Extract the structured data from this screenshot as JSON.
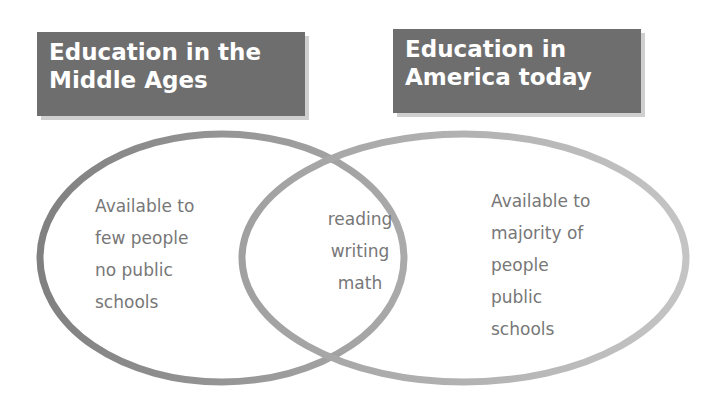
{
  "diagram": {
    "type": "venn",
    "sets": [
      {
        "id": "left",
        "title_lines": [
          "Education in the",
          "Middle Ages"
        ],
        "items": [
          "Available to",
          "few people",
          "no public",
          "schools"
        ]
      },
      {
        "id": "right",
        "title_lines": [
          "Education in",
          "America today"
        ],
        "items": [
          "Available to",
          "majority of",
          "people",
          "public",
          "schools"
        ]
      }
    ],
    "intersection": {
      "items": [
        "reading",
        "writing",
        "math"
      ]
    },
    "colors": {
      "title_box": "#6e6e6e",
      "title_text": "#ffffff",
      "left_ellipse_stroke": "#8a8a8a",
      "right_ellipse_stroke": "#b8b8b8",
      "label_text": "#777777"
    }
  }
}
